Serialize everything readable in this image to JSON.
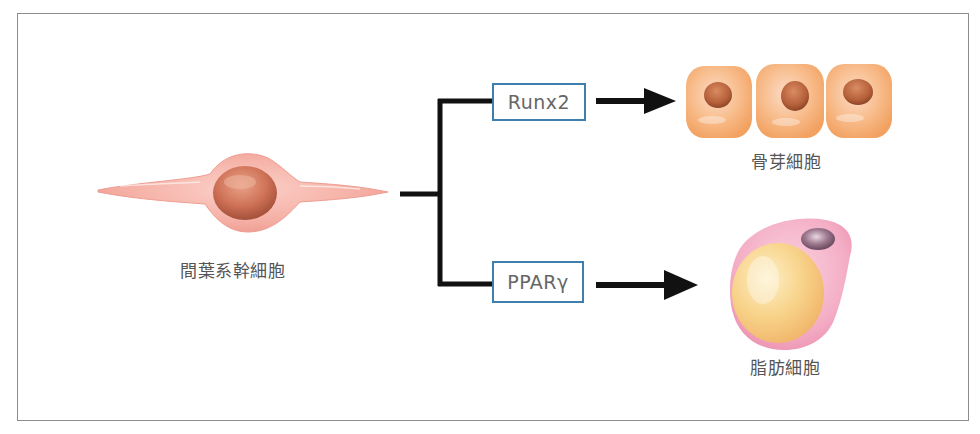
{
  "diagram": {
    "type": "differentiation-pathway",
    "source": {
      "label": "間葉系幹細胞",
      "shape": "spindle-cell"
    },
    "branches": [
      {
        "factor": "Runx2",
        "target_label": "骨芽細胞",
        "target_shape": "three-cuboidal-cells"
      },
      {
        "factor": "PPARγ",
        "target_label": "脂肪細胞",
        "target_shape": "adipocyte-with-lipid-droplet"
      }
    ]
  },
  "colors": {
    "connector": "#111111",
    "factor_box_border": "#3f7fae",
    "label_text": "#555555",
    "msc_body": "#f4a9a0",
    "msc_nucleus": "#c8644a",
    "osteoblast_body": "#f6b07a",
    "osteoblast_nucleus": "#b5603a",
    "adipocyte_body": "#f2a6bf",
    "lipid_droplet": "#f6cd7e",
    "adipocyte_nucleus": "#8c6478",
    "frame_border": "#8c8c8c"
  }
}
